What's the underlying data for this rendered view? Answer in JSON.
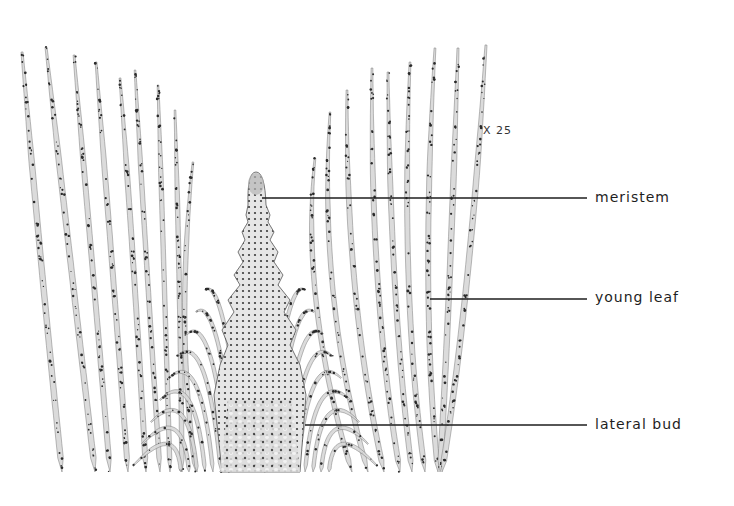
{
  "figure": {
    "magnification": "X 25",
    "labels": [
      {
        "id": "meristem",
        "text": "meristem",
        "line_y": 198,
        "line_x1": 262,
        "line_x2": 587
      },
      {
        "id": "young-leaf",
        "text": "young leaf",
        "line_y": 299,
        "line_x1": 430,
        "line_x2": 587
      },
      {
        "id": "lateral-bud",
        "text": "lateral bud",
        "line_y": 425,
        "line_x1": 305,
        "line_x2": 587
      }
    ],
    "colors": {
      "ink": "#1e1e1e",
      "strand_fill": "#d8d8d8",
      "strand_stroke": "#6a6a6a",
      "dot": "#2a2a2a",
      "background": "#ffffff"
    }
  }
}
